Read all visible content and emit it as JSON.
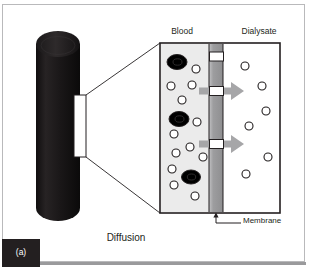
{
  "figure": {
    "panel_label": "(a)",
    "caption": "Diffusion",
    "labels": {
      "blood": "Blood",
      "dialysate": "Dialysate",
      "membrane": "Membrane"
    },
    "colors": {
      "frame_border": "#b9b9bb",
      "bottom_bar": "#9a9a9c",
      "cylinder_dark": "#1a1718",
      "blood_chamber_bg": "#ebebeb",
      "dialysate_chamber_bg": "#ffffff",
      "membrane_gray": "#9d9d9f",
      "arrow_gray": "#a6a6a8",
      "cell_fill": "#000000",
      "solute_stroke": "#231f20",
      "text": "#231f20",
      "badge_bg": "#231f20",
      "badge_text": "#ffffff"
    }
  },
  "diagram_data": {
    "type": "schematic",
    "subject": "haemodialysis diffusion across a semipermeable membrane",
    "dialyzer_cylinder": {
      "shape": "vertical cylinder with elliptical top cap",
      "x": 36,
      "y": 30,
      "width": 44,
      "height": 192,
      "fill": "#1a1718"
    },
    "callout_window": {
      "x": 74,
      "y": 95,
      "width": 12,
      "height": 62,
      "fill": "#ffffff",
      "stroke": "#231f20",
      "leader_lines": 2
    },
    "magnified_panel": {
      "x": 160,
      "y": 43,
      "width": 120,
      "height": 170,
      "stroke": "#231f20"
    },
    "chambers": [
      {
        "name": "Blood",
        "x": 161,
        "y": 44,
        "width": 48,
        "height": 168,
        "fill": "#ebebeb"
      },
      {
        "name": "Membrane",
        "x": 209,
        "y": 44,
        "width": 14,
        "height": 168,
        "fill": "#9d9d9f"
      },
      {
        "name": "Dialysate",
        "x": 223,
        "y": 44,
        "width": 56,
        "height": 168,
        "fill": "#ffffff"
      }
    ],
    "blood_cells": [
      {
        "cx": 177,
        "cy": 62,
        "rx": 10,
        "ry": 7.5
      },
      {
        "cx": 179,
        "cy": 119,
        "rx": 10,
        "ry": 7.5
      },
      {
        "cx": 191,
        "cy": 177,
        "rx": 9.5,
        "ry": 7
      }
    ],
    "blood_solutes": [
      {
        "cx": 196,
        "cy": 69,
        "r": 4
      },
      {
        "cx": 171,
        "cy": 86,
        "r": 4
      },
      {
        "cx": 192,
        "cy": 85,
        "r": 4
      },
      {
        "cx": 182,
        "cy": 100,
        "r": 4
      },
      {
        "cx": 197,
        "cy": 122,
        "r": 4
      },
      {
        "cx": 174,
        "cy": 134,
        "r": 4
      },
      {
        "cx": 190,
        "cy": 147,
        "r": 4
      },
      {
        "cx": 176,
        "cy": 153,
        "r": 4
      },
      {
        "cx": 172,
        "cy": 169,
        "r": 4
      },
      {
        "cx": 174,
        "cy": 185,
        "r": 4
      },
      {
        "cx": 195,
        "cy": 196,
        "r": 4
      },
      {
        "cx": 203,
        "cy": 155,
        "r": 4
      }
    ],
    "dialysate_solutes": [
      {
        "cx": 245,
        "cy": 66,
        "r": 4
      },
      {
        "cx": 262,
        "cy": 86,
        "r": 4
      },
      {
        "cx": 266,
        "cy": 111,
        "r": 4
      },
      {
        "cx": 249,
        "cy": 126,
        "r": 4
      },
      {
        "cx": 268,
        "cy": 157,
        "r": 4
      },
      {
        "cx": 246,
        "cy": 174,
        "r": 4
      }
    ],
    "membrane_pores": [
      {
        "x": 210,
        "y": 52,
        "width": 13,
        "height": 9
      },
      {
        "x": 210,
        "y": 87,
        "width": 13,
        "height": 9
      },
      {
        "x": 210,
        "y": 140,
        "width": 13,
        "height": 9
      }
    ],
    "diffusion_arrows": [
      {
        "from_x": 199,
        "to_x": 244,
        "y": 91,
        "direction": "blood-to-dialysate"
      },
      {
        "from_x": 199,
        "to_x": 244,
        "y": 144,
        "direction": "blood-to-dialysate"
      }
    ],
    "membrane_pointer": {
      "tip_x": 216,
      "tip_y": 213,
      "elbow_y": 223,
      "to_x": 240
    }
  }
}
